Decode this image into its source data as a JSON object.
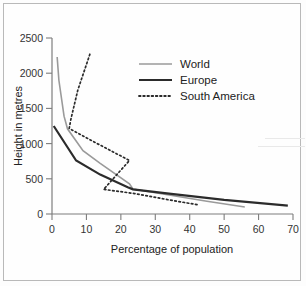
{
  "chart_data": {
    "type": "line",
    "title": "",
    "xlabel": "Percentage of population",
    "ylabel": "Height in metres",
    "xlim": [
      0,
      70
    ],
    "ylim": [
      0,
      2500
    ],
    "xticks": [
      0,
      10,
      20,
      30,
      40,
      50,
      60,
      70
    ],
    "yticks": [
      0,
      500,
      1000,
      1500,
      2000,
      2500
    ],
    "xtick_labels": [
      "0",
      "10",
      "20",
      "30",
      "40",
      "50",
      "60",
      "70"
    ],
    "ytick_labels": [
      "0",
      "500",
      "1000",
      "1500",
      "2000",
      "2500"
    ],
    "grid": false,
    "legend_position": "upper-right",
    "series": [
      {
        "name": "World",
        "style": "solid-thin",
        "color": "#9a9a9a",
        "points": [
          [
            1.5,
            2230
          ],
          [
            2.0,
            1900
          ],
          [
            3.5,
            1390
          ],
          [
            4.5,
            1210
          ],
          [
            9.0,
            900
          ],
          [
            14.0,
            720
          ],
          [
            22.5,
            430
          ],
          [
            23.5,
            355
          ],
          [
            34.0,
            270
          ],
          [
            45.0,
            180
          ],
          [
            56.0,
            100
          ]
        ]
      },
      {
        "name": "Europe",
        "style": "solid-thick",
        "color": "#2b2b2b",
        "points": [
          [
            0.5,
            1250
          ],
          [
            7.0,
            760
          ],
          [
            14.0,
            560
          ],
          [
            22.0,
            380
          ],
          [
            23.5,
            350
          ],
          [
            34.0,
            290
          ],
          [
            50.0,
            200
          ],
          [
            68.5,
            120
          ]
        ]
      },
      {
        "name": "South America",
        "style": "dotted",
        "color": "#2b2b2b",
        "points": [
          [
            11.0,
            2270
          ],
          [
            7.5,
            1760
          ],
          [
            5.5,
            1350
          ],
          [
            5.0,
            1215
          ],
          [
            12.0,
            1030
          ],
          [
            22.5,
            760
          ],
          [
            15.0,
            350
          ],
          [
            24.0,
            290
          ],
          [
            34.0,
            200
          ],
          [
            42.5,
            130
          ]
        ]
      }
    ]
  },
  "legend": {
    "items": [
      {
        "label": "World",
        "swatch": "solid-thin",
        "color": "#9a9a9a"
      },
      {
        "label": "Europe",
        "swatch": "solid-thick",
        "color": "#2b2b2b"
      },
      {
        "label": "South America",
        "swatch": "dotted",
        "color": "#2b2b2b"
      }
    ]
  },
  "axis": {
    "x_label": "Percentage of population",
    "y_label": "Height in metres"
  }
}
